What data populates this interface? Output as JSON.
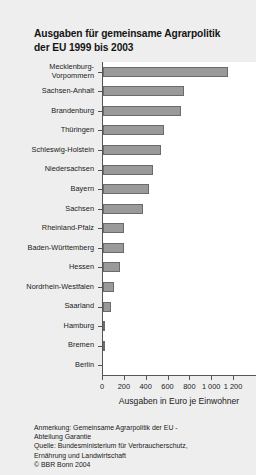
{
  "title": "Ausgaben für gemeinsame Agrarpolitik der EU 1999 bis 2003",
  "title_line1": "Ausgaben für gemeinsame Agrarpolitik",
  "title_line2": "der EU 1999 bis 2003",
  "footnotes": [
    "Anmerkung: Gemeinsame Agrarpolitik der EU -",
    "Abteilung Garantie",
    "Quelle: Bundesministerium für Verbraucherschutz,",
    "Ernährung und Landwirtschaft",
    "© BBR Bonn 2004"
  ],
  "colors": {
    "bar_fill": "#9a9a9a",
    "bar_edge": "#6b6b6b",
    "panel_bg": "#ffffff",
    "figure_bg": "#eeeeee",
    "axis": "#555555",
    "text": "#1a1a1a"
  },
  "chart_data": {
    "type": "bar",
    "orientation": "horizontal",
    "title": "Ausgaben für gemeinsame Agrarpolitik der EU 1999 bis 2003",
    "xlabel": "Ausgaben in Euro je Einwohner",
    "ylabel": "",
    "xlim": [
      0,
      1200
    ],
    "grid": false,
    "legend": null,
    "xticks": [
      0,
      200,
      400,
      600,
      800,
      1000,
      1200
    ],
    "xtick_labels": [
      "0",
      "200",
      "400",
      "600",
      "800",
      "1 000",
      "1 200"
    ],
    "categories": [
      "Mecklenburg-Vorpommern",
      "Sachsen-Anhalt",
      "Brandenburg",
      "Thüringen",
      "Schleswig-Holstein",
      "Niedersachsen",
      "Bayern",
      "Sachsen",
      "Rheinland-Pfalz",
      "Baden-Württemberg",
      "Hessen",
      "Nordrhein-Westfalen",
      "Saarland",
      "Hamburg",
      "Bremen",
      "Berlin"
    ],
    "values": [
      1145,
      740,
      715,
      560,
      530,
      455,
      420,
      365,
      195,
      188,
      155,
      105,
      75,
      20,
      15,
      3
    ]
  },
  "category_label_lines": [
    [
      "Mecklenburg-",
      "Vorpommern"
    ],
    [
      "Sachsen-Anhalt"
    ],
    [
      "Brandenburg"
    ],
    [
      "Thüringen"
    ],
    [
      "Schleswig-Holstein"
    ],
    [
      "Niedersachsen"
    ],
    [
      "Bayern"
    ],
    [
      "Sachsen"
    ],
    [
      "Rheinland-Pfalz"
    ],
    [
      "Baden-Württemberg"
    ],
    [
      "Hessen"
    ],
    [
      "Nordrhein-Westfalen"
    ],
    [
      "Saarland"
    ],
    [
      "Hamburg"
    ],
    [
      "Bremen"
    ],
    [
      "Berlin"
    ]
  ]
}
